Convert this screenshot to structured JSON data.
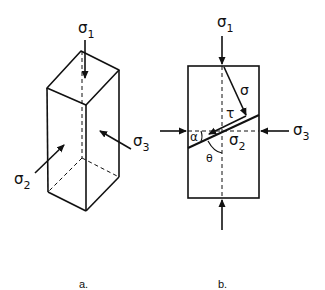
{
  "figure_a": {
    "caption": "a.",
    "labels": {
      "sigma1": "σ",
      "sigma1_sub": "1",
      "sigma2": "σ",
      "sigma2_sub": "2",
      "sigma3": "σ",
      "sigma3_sub": "3"
    }
  },
  "figure_b": {
    "caption": "b.",
    "labels": {
      "sigma1": "σ",
      "sigma1_sub": "1",
      "sigma2": "σ",
      "sigma2_sub": "2",
      "sigma3": "σ",
      "sigma3_sub": "3",
      "normal_stress": "σ",
      "shear_stress": "τ",
      "alpha": "α",
      "theta": "θ"
    }
  },
  "colors": {
    "line": "#111111",
    "background": "#ffffff"
  }
}
